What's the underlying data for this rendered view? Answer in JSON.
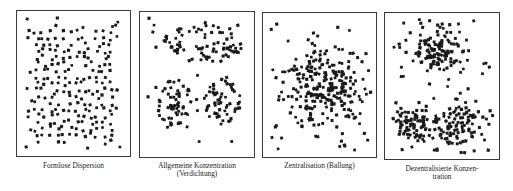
{
  "figure": {
    "dot_color": "#1a1a1a",
    "border_color": "#3a3a3a",
    "panels": [
      {
        "id": "formlose-dispersion",
        "caption": "Formlose Dispersion",
        "caption_line2": "",
        "box": {
          "x": 16,
          "y": 10,
          "w": 115,
          "h": 147
        },
        "caption_pos": {
          "x": 16,
          "y": 162,
          "w": 115
        },
        "pattern": "uniform",
        "clusters": [],
        "background_dots": 230,
        "seed": 11
      },
      {
        "id": "allgemeine-konzentration",
        "caption": "Allgemeine Konzentration",
        "caption_line2": "(Verdichtung)",
        "box": {
          "x": 139,
          "y": 11,
          "w": 116,
          "h": 147
        },
        "caption_pos": {
          "x": 135,
          "y": 162,
          "w": 124
        },
        "pattern": "blobs",
        "clusters": [
          {
            "cx": 0.55,
            "cy": 0.22,
            "rx": 0.36,
            "ry": 0.13,
            "n": 75
          },
          {
            "cx": 0.3,
            "cy": 0.63,
            "rx": 0.15,
            "ry": 0.18,
            "n": 55
          },
          {
            "cx": 0.72,
            "cy": 0.62,
            "rx": 0.16,
            "ry": 0.16,
            "n": 50
          }
        ],
        "background_dots": 30,
        "seed": 23
      },
      {
        "id": "zentralisation",
        "caption": "Zentralisation (Ballung)",
        "caption_line2": "",
        "box": {
          "x": 262,
          "y": 12,
          "w": 115,
          "h": 146
        },
        "caption_pos": {
          "x": 262,
          "y": 162,
          "w": 115
        },
        "pattern": "gaussian",
        "clusters": [
          {
            "cx": 0.52,
            "cy": 0.52,
            "sx": 0.16,
            "sy": 0.14,
            "n": 220
          }
        ],
        "background_dots": 55,
        "seed": 37
      },
      {
        "id": "dezentralisierte-konzentration",
        "caption": "Dezentralisierte Konzen-",
        "caption_line2": "tration",
        "box": {
          "x": 384,
          "y": 12,
          "w": 116,
          "h": 148
        },
        "caption_pos": {
          "x": 384,
          "y": 165,
          "w": 116
        },
        "pattern": "gaussian",
        "clusters": [
          {
            "cx": 0.47,
            "cy": 0.26,
            "sx": 0.13,
            "sy": 0.09,
            "n": 120
          },
          {
            "cx": 0.24,
            "cy": 0.75,
            "sx": 0.1,
            "sy": 0.075,
            "n": 85
          },
          {
            "cx": 0.66,
            "cy": 0.76,
            "sx": 0.12,
            "sy": 0.08,
            "n": 95
          }
        ],
        "background_dots": 45,
        "seed": 53
      }
    ]
  }
}
